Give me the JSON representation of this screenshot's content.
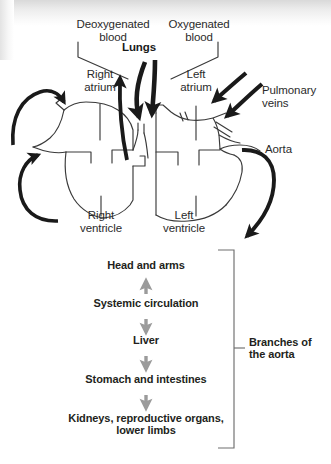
{
  "figure": {
    "background_color": "#ffffff",
    "ink_color": "#231f20",
    "arrow_dark_color": "#1a1a1a",
    "arrow_gray_color": "#9b9b9b",
    "outline_color": "#3a3a3a"
  },
  "heart_diagram": {
    "labels": {
      "deoxygenated_blood": "Deoxygenated\nblood",
      "oxygenated_blood": "Oxygenated\nblood",
      "lungs": "Lungs",
      "right_atrium": "Right\natrium",
      "left_atrium": "Left\natrium",
      "right_ventricle": "Right\nventricle",
      "left_ventricle": "Left\nventricle",
      "pulmonary_veins": "Pulmonary\nveins",
      "aorta": "Aorta"
    }
  },
  "systemic_flow": {
    "steps": [
      "Head and arms",
      "Systemic circulation",
      "Liver",
      "Stomach and intestines",
      "Kidneys, reproductive organs,\nlower limbs"
    ],
    "bracket_label": "Branches of\nthe aorta"
  }
}
